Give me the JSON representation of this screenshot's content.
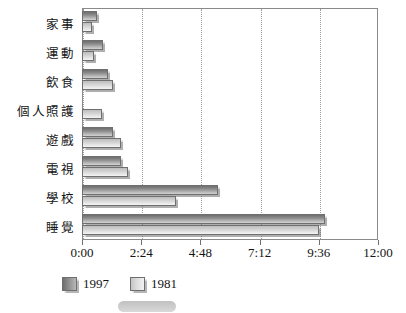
{
  "chart_data": {
    "type": "bar",
    "orientation": "horizontal",
    "title": "",
    "xlabel": "",
    "ylabel": "",
    "xlim": [
      0,
      12
    ],
    "xtick_labels": [
      "0:00",
      "2:24",
      "4:48",
      "7:12",
      "9:36",
      "12:00"
    ],
    "xtick_values": [
      0,
      2.4,
      4.8,
      7.2,
      9.6,
      12
    ],
    "grid": true,
    "grid_axis": "x",
    "legend_position": "bottom-left",
    "categories": [
      "家事",
      "運動",
      "飲食",
      "個人照護",
      "遊戲",
      "電視",
      "學校",
      "睡覺"
    ],
    "series": [
      {
        "name": "1997",
        "color": "#8c8c8c",
        "values": [
          0.62,
          0.85,
          1.05,
          0.0,
          1.25,
          1.58,
          5.5,
          9.85
        ]
      },
      {
        "name": "1981",
        "color": "#dcdcdc",
        "values": [
          0.42,
          0.5,
          1.27,
          0.82,
          1.58,
          1.85,
          3.8,
          9.6
        ]
      }
    ],
    "value_unit": "hours:minutes per day"
  },
  "legend": {
    "items": [
      {
        "label": "1997",
        "series": "s1997"
      },
      {
        "label": "1981",
        "series": "s1981"
      }
    ]
  },
  "caption": {
    "text": ""
  }
}
